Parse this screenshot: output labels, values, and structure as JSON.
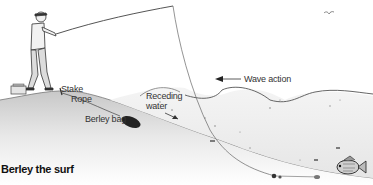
{
  "figure": {
    "caption": "Berley the surf",
    "labels": {
      "stake": "Stake",
      "rope": "Rope",
      "receding_water_line1": "Receding",
      "receding_water_line2": "water",
      "berley_bag": "Berley bag",
      "wave_action": "Wave action"
    },
    "elements": [
      "angler-with-rod",
      "tackle-box",
      "fishing-line",
      "berley-bag",
      "waves",
      "sinker",
      "fish",
      "seagull"
    ]
  }
}
